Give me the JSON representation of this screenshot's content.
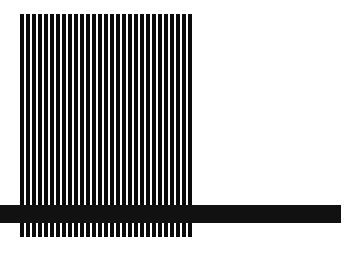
{
  "canvas": {
    "width": 350,
    "height": 254,
    "background_color": "#ffffff",
    "title": "Abstract Stripe Composition"
  },
  "artwork": {
    "ink_color": "#0a0a0a",
    "bar_color": "#111111",
    "description": "Vertical black stripe field crossed near the bottom by a horizontal black bar extending to the right edge"
  },
  "stripe_field": {
    "name": "vertical-stripe-field",
    "x": 20,
    "y": 14,
    "width": 175,
    "height": 223,
    "count": 29,
    "pitch": 6,
    "stripe_width": 3.6,
    "color": "#0a0a0a"
  },
  "cross_bar": {
    "name": "horizontal-cross-bar",
    "x": 0,
    "y": 205,
    "width": 341,
    "height": 18,
    "color": "#111111"
  },
  "chart_data": {
    "type": "bar",
    "subtitle": "",
    "xlabel": "",
    "ylabel": "",
    "grid": false,
    "legend": null,
    "orientation": "vertical",
    "categories": [
      "1",
      "2",
      "3",
      "4",
      "5",
      "6",
      "7",
      "8",
      "9",
      "10",
      "11",
      "12",
      "13",
      "14",
      "15",
      "16",
      "17",
      "18",
      "19",
      "20",
      "21",
      "22",
      "23",
      "24",
      "25",
      "26",
      "27",
      "28",
      "29"
    ],
    "values": [
      223,
      223,
      223,
      223,
      223,
      223,
      223,
      223,
      223,
      223,
      223,
      223,
      223,
      223,
      223,
      223,
      223,
      223,
      223,
      223,
      223,
      223,
      223,
      223,
      223,
      223,
      223,
      223,
      223
    ],
    "xlim": [
      20,
      195
    ],
    "ylim": [
      14,
      237
    ],
    "bar_width": 3.6,
    "bar_pitch": 6,
    "annotations": [
      {
        "name": "horizontal-cross-bar",
        "type": "hspan",
        "y_start": 205,
        "y_end": 223,
        "x_start": 0,
        "x_end": 341,
        "color": "#111111"
      }
    ]
  }
}
